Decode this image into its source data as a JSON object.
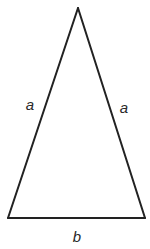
{
  "diagram": {
    "type": "isosceles-triangle",
    "stroke_color": "#222222",
    "vertices": {
      "apex": [
        78,
        8
      ],
      "bottom_left": [
        8,
        218
      ],
      "bottom_right": [
        145,
        218
      ]
    },
    "labels": {
      "left_side": "a",
      "right_side": "a",
      "base": "b"
    }
  }
}
